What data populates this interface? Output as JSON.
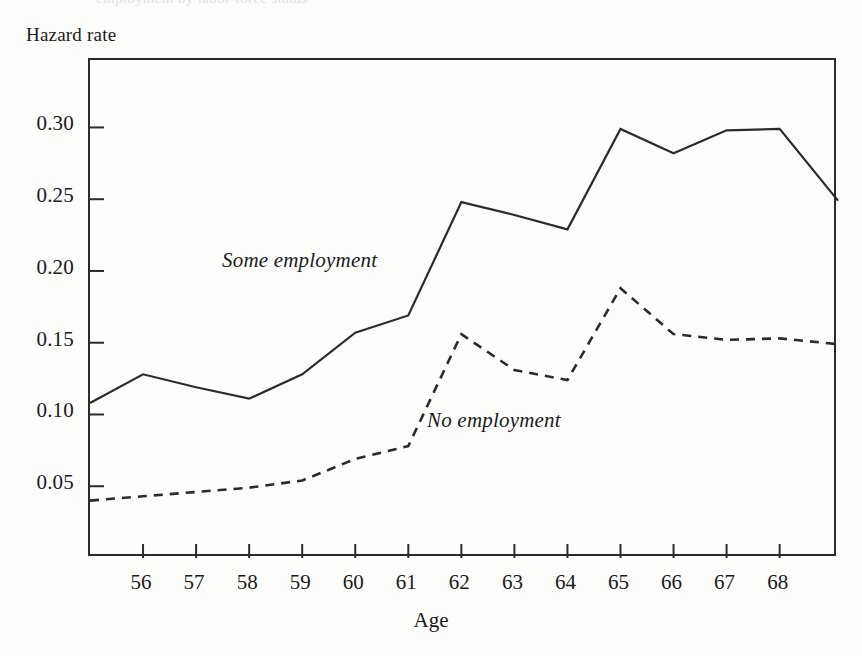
{
  "header": {
    "clipped_text": "employment by labor-force status"
  },
  "axes": {
    "ylabel": "Hazard rate",
    "xlabel": "Age",
    "yticks": [
      "0.05",
      "0.10",
      "0.15",
      "0.20",
      "0.25",
      "0.30"
    ],
    "xticks": [
      "56",
      "57",
      "58",
      "59",
      "60",
      "61",
      "62",
      "63",
      "64",
      "65",
      "66",
      "67",
      "68"
    ]
  },
  "annotations": {
    "some_employment": "Some employment",
    "no_employment": "No employment"
  },
  "colors": {
    "ink": "#2b2b2b",
    "background": "#fdfdfc"
  },
  "chart_data": {
    "type": "line",
    "title": "",
    "xlabel": "Age",
    "ylabel": "Hazard rate",
    "xlim": [
      55.0,
      69.1
    ],
    "ylim": [
      0.0,
      0.347
    ],
    "grid": false,
    "legend": "inline-annotations",
    "yticks": [
      0.05,
      0.1,
      0.15,
      0.2,
      0.25,
      0.3
    ],
    "xticks": [
      56,
      57,
      58,
      59,
      60,
      61,
      62,
      63,
      64,
      65,
      66,
      67,
      68
    ],
    "x": [
      55.0,
      56,
      57,
      58,
      59,
      60,
      61,
      62,
      63,
      64,
      65,
      66,
      67,
      68,
      69.1
    ],
    "series": [
      {
        "name": "Some employment",
        "style": "solid",
        "values": [
          0.108,
          0.128,
          0.119,
          0.111,
          0.128,
          0.157,
          0.169,
          0.248,
          0.239,
          0.229,
          0.299,
          0.282,
          0.298,
          0.299,
          0.249
        ]
      },
      {
        "name": "No employment",
        "style": "dashed",
        "values": [
          0.04,
          0.043,
          0.046,
          0.049,
          0.054,
          0.069,
          0.078,
          0.156,
          0.131,
          0.124,
          0.188,
          0.156,
          0.152,
          0.153,
          0.149
        ]
      }
    ]
  }
}
